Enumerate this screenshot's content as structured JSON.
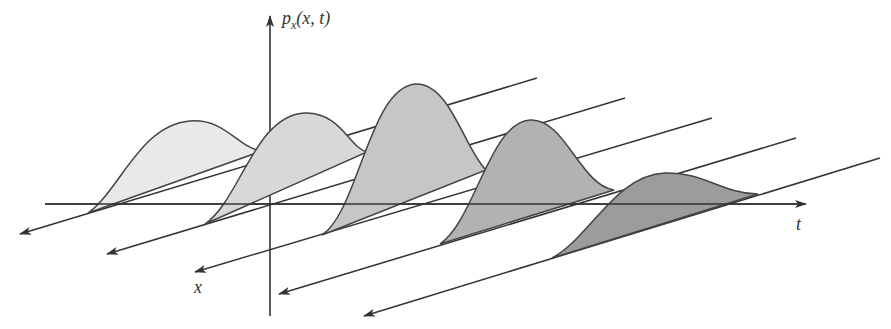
{
  "diagram": {
    "labels": {
      "y_axis_main": "p",
      "y_axis_sub": "x",
      "y_axis_args": "(x, t)",
      "t_axis": "t",
      "x_axis": "x"
    },
    "colors": {
      "axis": "#333333",
      "curve_stroke": "#444444",
      "fills": [
        "#e9e9e9",
        "#d8d8d8",
        "#c6c6c6",
        "#b2b2b2",
        "#9c9c9c"
      ]
    },
    "curves": [
      {
        "name": "density-slice-1",
        "order": 1
      },
      {
        "name": "density-slice-2",
        "order": 2
      },
      {
        "name": "density-slice-3",
        "order": 3
      },
      {
        "name": "density-slice-4",
        "order": 4
      },
      {
        "name": "density-slice-5",
        "order": 5
      }
    ]
  }
}
